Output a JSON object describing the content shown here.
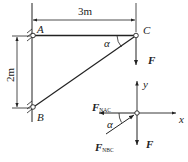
{
  "diagram": {
    "type": "truss-statics",
    "dimensions": {
      "horizontal": "3m",
      "vertical": "2m"
    },
    "points": {
      "A": "A",
      "B": "B",
      "C": "C"
    },
    "angle": "α",
    "load": "F",
    "free_body": {
      "axis_x": "x",
      "axis_y": "y",
      "force_ac": {
        "main": "F",
        "sub": "NAC"
      },
      "force_bc": {
        "main": "F",
        "sub": "NBC"
      },
      "force_load": "F",
      "angle": "α"
    }
  }
}
